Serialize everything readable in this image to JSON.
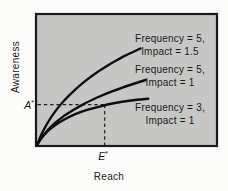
{
  "chart_data": {
    "type": "line",
    "title": "",
    "xlabel": "Reach",
    "ylabel": "Awareness",
    "x_range_norm": [
      0,
      1
    ],
    "y_range_norm": [
      0,
      1
    ],
    "grid": "off",
    "axis_ticks": "none",
    "legend": "inline-labels",
    "series": [
      {
        "name": "Frequency = 5, Impact = 1.5",
        "frequency": 5,
        "impact": 1.5,
        "label_lines": [
          "Frequency = 5,",
          "Impact = 1.5"
        ],
        "points": [
          [
            0,
            0
          ],
          [
            0.028,
            0.091
          ],
          [
            0.062,
            0.177
          ],
          [
            0.103,
            0.261
          ],
          [
            0.151,
            0.341
          ],
          [
            0.206,
            0.417
          ],
          [
            0.267,
            0.489
          ],
          [
            0.334,
            0.558
          ],
          [
            0.409,
            0.623
          ],
          [
            0.49,
            0.685
          ],
          [
            0.578,
            0.742
          ]
        ]
      },
      {
        "name": "Frequency = 5, Impact = 1",
        "frequency": 5,
        "impact": 1,
        "label_lines": [
          "Frequency = 5,",
          "Impact = 1"
        ],
        "points": [
          [
            0,
            0
          ],
          [
            0.026,
            0.058
          ],
          [
            0.06,
            0.114
          ],
          [
            0.101,
            0.169
          ],
          [
            0.15,
            0.222
          ],
          [
            0.207,
            0.273
          ],
          [
            0.271,
            0.322
          ],
          [
            0.343,
            0.369
          ],
          [
            0.423,
            0.414
          ],
          [
            0.511,
            0.458
          ],
          [
            0.606,
            0.5
          ]
        ]
      },
      {
        "name": "Frequency = 3, Impact = 1",
        "frequency": 3,
        "impact": 1,
        "label_lines": [
          "Frequency = 3,",
          "Impact = 1"
        ],
        "points": [
          [
            0,
            0
          ],
          [
            0.027,
            0.057
          ],
          [
            0.062,
            0.109
          ],
          [
            0.105,
            0.156
          ],
          [
            0.156,
            0.198
          ],
          [
            0.214,
            0.237
          ],
          [
            0.28,
            0.27
          ],
          [
            0.354,
            0.298
          ],
          [
            0.436,
            0.323
          ],
          [
            0.525,
            0.342
          ],
          [
            0.622,
            0.356
          ]
        ]
      }
    ],
    "annotations": {
      "awareness_level": {
        "text": "A*",
        "symbol": "A",
        "sup": "*",
        "norm_y": 0.31
      },
      "effective_reach": {
        "text": "E*",
        "symbol": "E",
        "sup": "*",
        "norm_x": 0.378
      }
    }
  },
  "colors": {
    "plot_fill": "#c6c6c4",
    "plot_border": "#1a1a1a",
    "curve": "#0d0d0d",
    "dashed_line": "#222222",
    "text": "#1a1a1a",
    "background": "#fcfcfa"
  }
}
